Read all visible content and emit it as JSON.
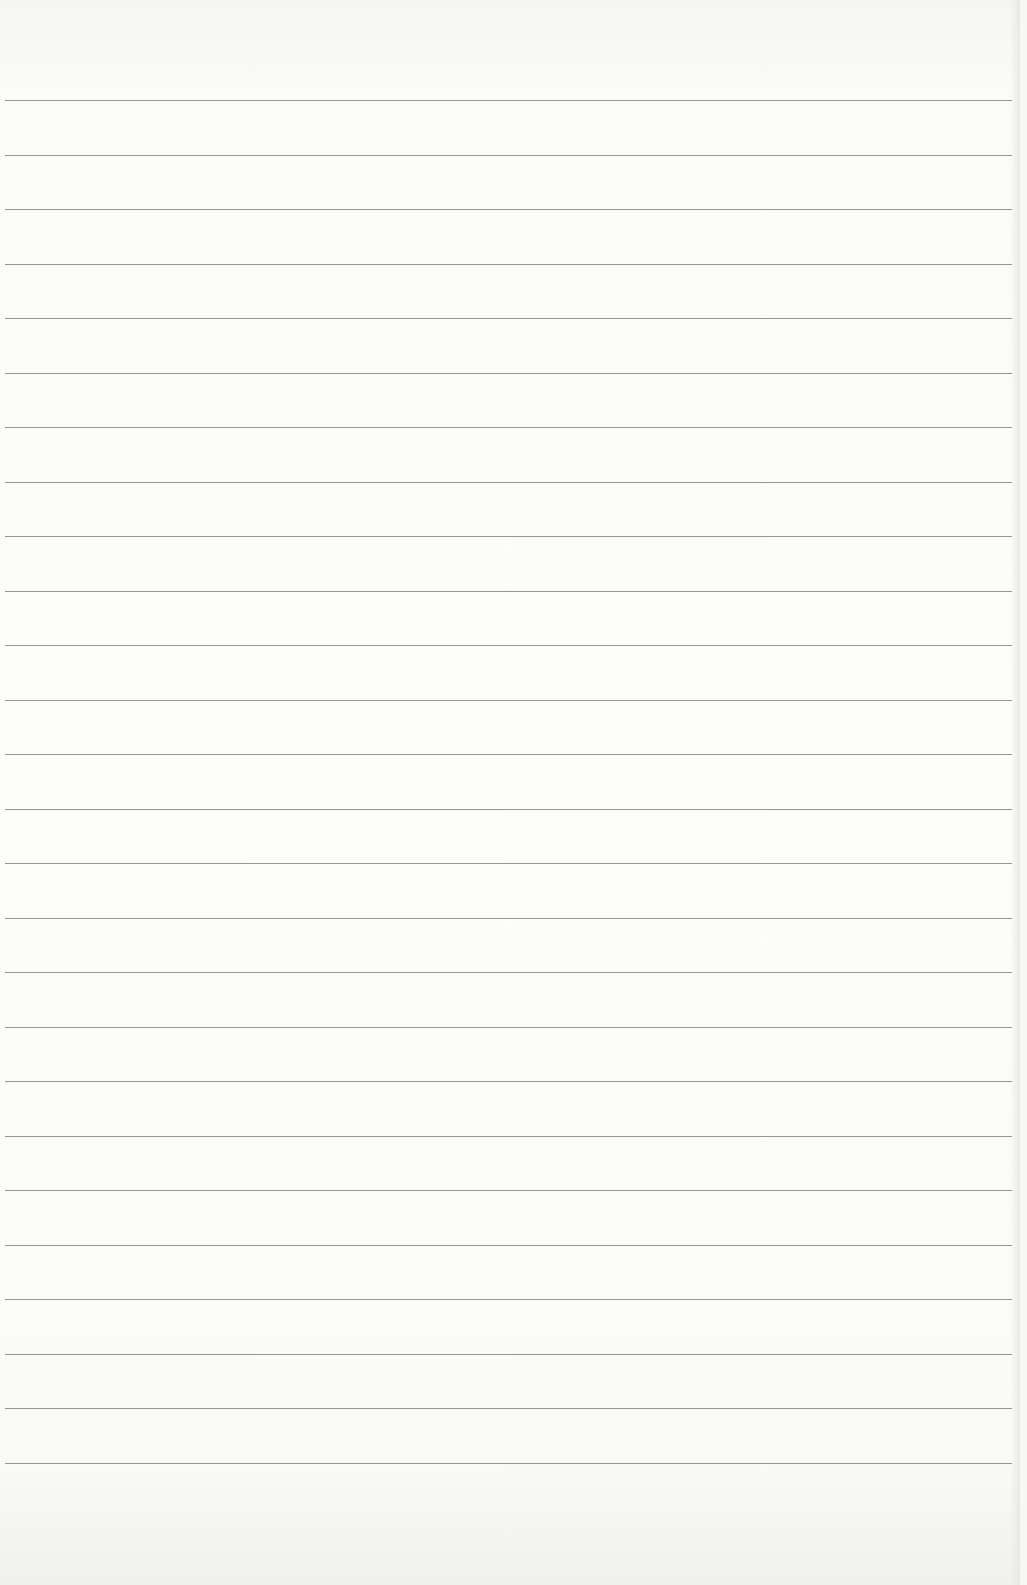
{
  "page": {
    "type": "ruled-paper",
    "background_color": "#fdfdfc",
    "rule_color": "#8a8a8a",
    "rule_count": 26,
    "first_rule_y": 100,
    "rule_spacing": 54.5,
    "text": ""
  }
}
